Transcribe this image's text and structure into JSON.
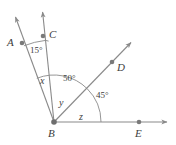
{
  "figure": {
    "type": "geometry-diagram",
    "canvas": {
      "width": 176,
      "height": 145,
      "background": "#ffffff"
    },
    "colors": {
      "line": "#8a8a8a",
      "arc": "#8a8a8a",
      "point": "#7a7a7a",
      "text": "#3d3d3d"
    },
    "vertex": {
      "name": "B",
      "x": 54,
      "y": 122
    },
    "points": [
      {
        "name": "A",
        "label": "A",
        "dot_x": 22,
        "dot_y": 43,
        "label_x": 7,
        "label_y": 37
      },
      {
        "name": "C",
        "label": "C",
        "dot_x": 43,
        "dot_y": 36,
        "label_x": 49,
        "label_y": 29
      },
      {
        "name": "D",
        "label": "D",
        "dot_x": 112,
        "dot_y": 62,
        "label_x": 117,
        "label_y": 62
      },
      {
        "name": "E",
        "label": "E",
        "dot_x": 139,
        "dot_y": 122,
        "label_x": 135,
        "label_y": 128
      },
      {
        "name": "B",
        "label": "B",
        "dot_x": 54,
        "dot_y": 122,
        "label_x": 48,
        "label_y": 128
      }
    ],
    "rays": [
      {
        "name": "ray-BA",
        "from": "B",
        "through": "A",
        "tip_x": 13,
        "tip_y": 14
      },
      {
        "name": "ray-BC",
        "from": "B",
        "through": "C",
        "tip_x": 42,
        "tip_y": 9
      },
      {
        "name": "ray-BD",
        "from": "B",
        "through": "D",
        "tip_x": 134,
        "tip_y": 40
      },
      {
        "name": "ray-BE",
        "from": "B",
        "through": "E",
        "tip_x": 170,
        "tip_y": 122
      }
    ],
    "angles": [
      {
        "name": "angle-ABC",
        "label": "15°",
        "kind": "measure",
        "label_x": 30,
        "label_y": 46
      },
      {
        "name": "angle-x",
        "label": "x",
        "kind": "variable",
        "label_x": 40,
        "label_y": 76
      },
      {
        "name": "angle-CBD",
        "label": "50°",
        "kind": "measure",
        "label_x": 63,
        "label_y": 74
      },
      {
        "name": "angle-y",
        "label": "y",
        "kind": "variable",
        "label_x": 59,
        "label_y": 98
      },
      {
        "name": "angle-DBE",
        "label": "45°",
        "kind": "measure",
        "label_x": 96,
        "label_y": 91
      },
      {
        "name": "angle-z",
        "label": "z",
        "kind": "variable",
        "label_x": 79,
        "label_y": 112
      }
    ]
  }
}
